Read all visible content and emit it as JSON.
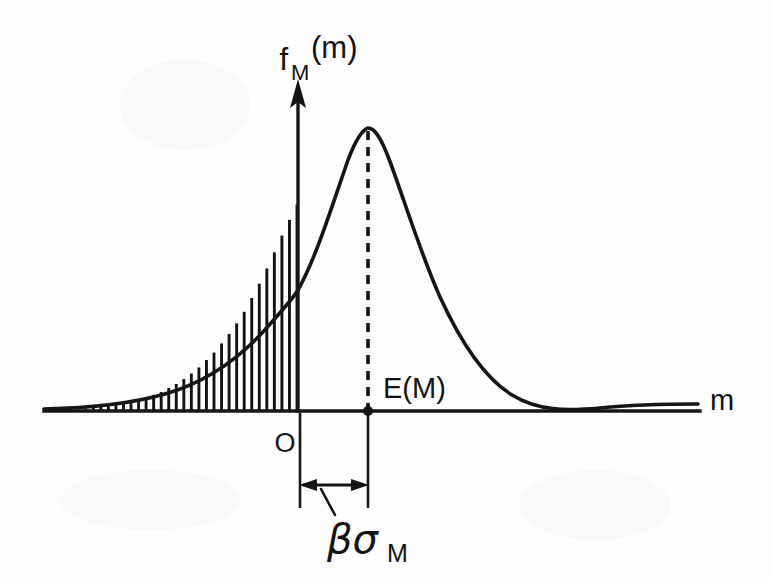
{
  "figure": {
    "kind": "probability-density-diagram",
    "background_color": "#fefefe",
    "ink_color": "#141414"
  },
  "labels": {
    "y_axis_main": "f",
    "y_axis_subscript": "M",
    "y_axis_argument": "(m)",
    "x_axis": "m",
    "origin": "O",
    "mean": "E(M)",
    "dimension_greek": "βσ",
    "dimension_subscript": "M"
  },
  "chart_data": {
    "type": "line",
    "title": "",
    "subtitle": "",
    "xlabel": "m",
    "ylabel": "f_M(m)",
    "legend_position": "none",
    "grid": false,
    "axis_style": "single-quadrant-arrow",
    "xlim": [
      -3.45,
      4.6
    ],
    "ylim": [
      0,
      1.12
    ],
    "annotations": [
      {
        "name": "origin-label",
        "text": "O",
        "x": -0.16,
        "y": -0.09
      },
      {
        "name": "mean-label",
        "text": "E(M)",
        "x": 0.22,
        "y": 0.07
      },
      {
        "name": "mean-marker",
        "text": "",
        "x": 0,
        "y": 0
      },
      {
        "name": "dimension-label",
        "text": "βσ_M",
        "x": -0.55,
        "y": -0.42
      }
    ],
    "shaded_region": {
      "name": "failure-probability-area",
      "fill_style": "vertical-hatching",
      "hatch_count": 34,
      "x_from": -3.42,
      "x_to": 0,
      "description": "Area under the density for m < 0"
    },
    "markers": [
      {
        "name": "mean-dot",
        "x": 0,
        "y": 0,
        "style": "filled-circle"
      }
    ],
    "reference_lines": [
      {
        "name": "mean-dashed-line",
        "orientation": "vertical",
        "x": 0,
        "y_from": 0,
        "y_to": 1.0,
        "style": "dashed"
      }
    ],
    "dimension": {
      "name": "beta-sigma-dimension",
      "label": "βσ_M",
      "from_x": -1.0,
      "to_x": 0,
      "style": "double-headed-arrow"
    },
    "series": [
      {
        "name": "f_M(m)",
        "style": "solid",
        "x": [
          -3.45,
          -3.2,
          -2.95,
          -2.7,
          -2.45,
          -2.2,
          -1.95,
          -1.7,
          -1.45,
          -1.2,
          -1.0,
          -0.8,
          -0.6,
          -0.4,
          -0.2,
          0.0,
          0.2,
          0.4,
          0.6,
          0.8,
          1.0,
          1.2,
          1.45,
          1.7,
          1.95,
          2.2,
          2.45,
          2.7,
          2.95,
          3.2,
          3.45,
          3.8,
          4.2,
          4.6
        ],
        "y": [
          0.006,
          0.009,
          0.014,
          0.021,
          0.032,
          0.048,
          0.071,
          0.104,
          0.149,
          0.21,
          0.27,
          0.34,
          0.43,
          0.53,
          0.64,
          0.74,
          0.84,
          0.92,
          0.97,
          1.0,
          0.99,
          0.95,
          0.86,
          0.73,
          0.59,
          0.44,
          0.31,
          0.2,
          0.12,
          0.07,
          0.04,
          0.02,
          0.013,
          0.011
        ]
      }
    ]
  },
  "geometry": {
    "origin_px": {
      "x": 298,
      "y": 411
    },
    "mean_px": {
      "x": 368,
      "y": 411
    },
    "peak_px": {
      "x": 368,
      "y": 128
    },
    "x_axis_left_px": 44,
    "x_axis_right_px": 700,
    "y_axis_top_px": 82,
    "hatch_left_px": 48,
    "dimension_row_px": 485
  }
}
